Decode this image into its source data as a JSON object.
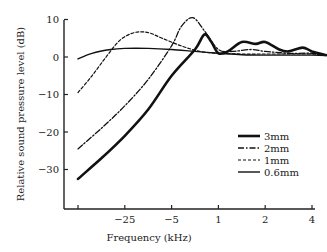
{
  "chart_data": {
    "type": "line",
    "title": "",
    "xlabel": "Frequency (kHz)",
    "ylabel": "Relative sound pressure level (dB)",
    "x_ticks": [
      "",
      "−25",
      "−5",
      "1",
      "2",
      "4"
    ],
    "y_ticks": [
      10,
      0,
      -10,
      -20,
      -30
    ],
    "ylim": [
      -40,
      10
    ],
    "grid": false,
    "legend_position": "lower right (inside)",
    "x_positions_note": "tick index 0..5 corresponds to labels above",
    "series": [
      {
        "name": "3mm",
        "style": "solid-thick",
        "points": [
          [
            0,
            -32.5
          ],
          [
            0.5,
            -27
          ],
          [
            1,
            -21
          ],
          [
            1.5,
            -14
          ],
          [
            2,
            -5
          ],
          [
            2.5,
            2
          ],
          [
            2.7,
            6
          ],
          [
            2.85,
            4
          ],
          [
            3,
            1
          ],
          [
            3.2,
            1.5
          ],
          [
            3.5,
            4
          ],
          [
            3.8,
            3.5
          ],
          [
            4,
            4
          ],
          [
            4.3,
            2
          ],
          [
            4.5,
            1.5
          ],
          [
            4.8,
            2.5
          ],
          [
            5,
            1.5
          ],
          [
            5.3,
            0.5
          ]
        ]
      },
      {
        "name": "2mm",
        "style": "dash-dot",
        "points": [
          [
            0,
            -24.5
          ],
          [
            0.5,
            -19
          ],
          [
            1,
            -13
          ],
          [
            1.5,
            -6
          ],
          [
            2,
            3
          ],
          [
            2.2,
            8
          ],
          [
            2.45,
            10.5
          ],
          [
            2.7,
            7
          ],
          [
            3,
            2
          ],
          [
            3.3,
            1.5
          ],
          [
            3.7,
            2
          ],
          [
            4,
            1.5
          ],
          [
            4.5,
            1
          ],
          [
            5,
            1
          ],
          [
            5.3,
            0.5
          ]
        ]
      },
      {
        "name": "1mm",
        "style": "dashed",
        "points": [
          [
            0,
            -9.5
          ],
          [
            0.3,
            -5
          ],
          [
            0.6,
            0
          ],
          [
            0.9,
            4.5
          ],
          [
            1.2,
            6.5
          ],
          [
            1.5,
            6.5
          ],
          [
            1.8,
            5
          ],
          [
            2.2,
            3
          ],
          [
            2.6,
            1.5
          ],
          [
            3,
            1
          ],
          [
            3.5,
            0.8
          ],
          [
            4,
            0.8
          ],
          [
            4.5,
            0.8
          ],
          [
            5,
            0.8
          ],
          [
            5.3,
            0.5
          ]
        ]
      },
      {
        "name": "0.6mm",
        "style": "solid-thin",
        "points": [
          [
            0,
            -0.5
          ],
          [
            0.3,
            1
          ],
          [
            0.7,
            2
          ],
          [
            1,
            2.3
          ],
          [
            1.5,
            2.3
          ],
          [
            2,
            2
          ],
          [
            2.5,
            1.5
          ],
          [
            3,
            1
          ],
          [
            3.5,
            0.6
          ],
          [
            4,
            0.5
          ],
          [
            4.5,
            0.5
          ],
          [
            5,
            0.5
          ],
          [
            5.3,
            0.4
          ]
        ]
      }
    ]
  },
  "legend": {
    "items": [
      {
        "label": "3mm",
        "style": "solid-thick"
      },
      {
        "label": "2mm",
        "style": "dash-dot"
      },
      {
        "label": "1mm",
        "style": "dashed"
      },
      {
        "label": "0.6mm",
        "style": "solid-thin"
      }
    ]
  },
  "axes": {
    "x_title": "Frequency (kHz)",
    "y_title": "Relative sound pressure level (dB)",
    "x_tick_labels": [
      "",
      "−25",
      "−5",
      "1",
      "2",
      "4"
    ],
    "y_tick_labels": [
      "10",
      "0",
      "−10",
      "−20",
      "−30"
    ]
  }
}
